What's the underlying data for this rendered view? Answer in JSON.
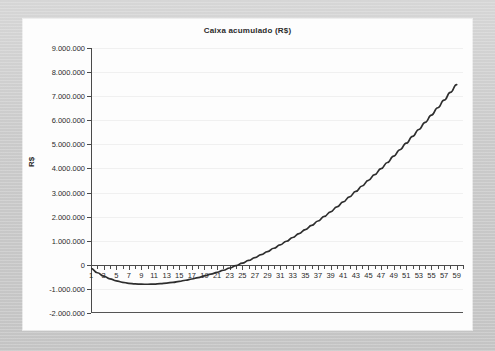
{
  "chart_data": {
    "type": "line",
    "title": "Caixa acumulado (R$)",
    "xlabel": "",
    "ylabel": "R$",
    "ylim": [
      -2000000,
      9000000
    ],
    "xlim": [
      1,
      60
    ],
    "grid": true,
    "legend": "none",
    "y_tick_labels": [
      "9.000.000",
      "8.000.000",
      "7.000.000",
      "6.000.000",
      "5.000.000",
      "4.000.000",
      "3.000.000",
      "2.000.000",
      "1.000.000",
      "0",
      "-1.000.000",
      "-2.000.000"
    ],
    "y_tick_values": [
      9000000,
      8000000,
      7000000,
      6000000,
      5000000,
      4000000,
      3000000,
      2000000,
      1000000,
      0,
      -1000000,
      -2000000
    ],
    "x_tick_labels": [
      "1",
      "3",
      "5",
      "7",
      "9",
      "11",
      "13",
      "15",
      "17",
      "19",
      "21",
      "23",
      "25",
      "27",
      "29",
      "31",
      "33",
      "35",
      "37",
      "39",
      "41",
      "43",
      "45",
      "47",
      "49",
      "51",
      "53",
      "55",
      "57",
      "59"
    ],
    "x_tick_values": [
      1,
      3,
      5,
      7,
      9,
      11,
      13,
      15,
      17,
      19,
      21,
      23,
      25,
      27,
      29,
      31,
      33,
      35,
      37,
      39,
      41,
      43,
      45,
      47,
      49,
      51,
      53,
      55,
      57,
      59
    ],
    "series": [
      {
        "name": "Caixa acumulado",
        "color": "#2e2e2e",
        "x": [
          1,
          2,
          3,
          4,
          5,
          6,
          7,
          8,
          9,
          10,
          11,
          12,
          13,
          14,
          15,
          16,
          17,
          18,
          19,
          20,
          21,
          22,
          23,
          24,
          25,
          26,
          27,
          28,
          29,
          30,
          31,
          32,
          33,
          34,
          35,
          36,
          37,
          38,
          39,
          40,
          41,
          42,
          43,
          44,
          45,
          46,
          47,
          48,
          49,
          50,
          51,
          52,
          53,
          54,
          55,
          56,
          57,
          58,
          59
        ],
        "values": [
          -150000,
          -330000,
          -470000,
          -580000,
          -665000,
          -725000,
          -768000,
          -793000,
          -805000,
          -806000,
          -798000,
          -782000,
          -758000,
          -726000,
          -687000,
          -641000,
          -588000,
          -528000,
          -462000,
          -389000,
          -310000,
          -225000,
          -133000,
          -35000,
          70000,
          181000,
          298000,
          421000,
          551000,
          687000,
          829000,
          978000,
          1133000,
          1295000,
          1463000,
          1638000,
          1819000,
          2007000,
          2201000,
          2402000,
          2610000,
          2824000,
          3045000,
          3272000,
          3506000,
          3747000,
          3994000,
          4248000,
          4509000,
          4776000,
          5050000,
          5331000,
          5618000,
          5912000,
          6213000,
          6520000,
          6834000,
          7155000,
          7482000
        ]
      }
    ]
  },
  "frame": {
    "background_color": "#cacaca",
    "card_color": "#fdfdfd",
    "axis_color": "#4a4a4a",
    "grid_color": "#f0f0f0"
  }
}
